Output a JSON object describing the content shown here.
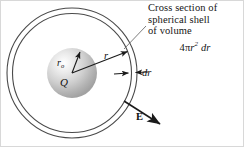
{
  "figure": {
    "title": "Cross section of spherical shell",
    "background_color": "#ffffff",
    "line_color": "#3a3a3a",
    "text_color": "#101010"
  },
  "caption": {
    "line1": "Cross section of",
    "line2": "spherical shell",
    "line3": "of volume",
    "formula_prefix": "4π",
    "formula_var": "r",
    "formula_exponent": "2",
    "formula_suffix": "dr"
  },
  "labels": {
    "inner_radius": "r",
    "inner_radius_sub": "o",
    "charge": "Q",
    "radius": "r",
    "thickness": "dr",
    "field": "E"
  },
  "geometry": {
    "center_x": 72,
    "center_y": 73,
    "outer_shell_radius": 65,
    "inner_shell_radius": 60,
    "sphere_radius": 25
  },
  "icons": {
    "radius_arrow": "arrow-right",
    "field_arrow": "arrow-outward",
    "thickness_arrows": "arrow-pair-inward",
    "leader_line": "leader-line"
  }
}
